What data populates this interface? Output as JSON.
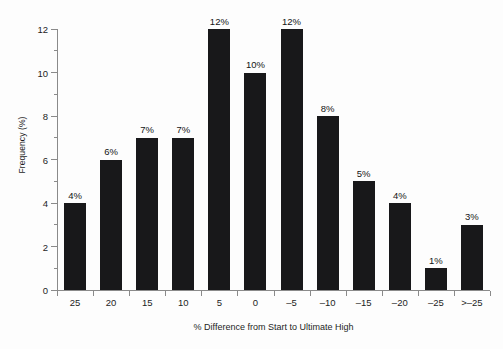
{
  "chart_data": {
    "type": "bar",
    "title": "",
    "subtitle": "",
    "xlabel": "% Difference from Start to Ultimate High",
    "ylabel": "Frequency (%)",
    "categories": [
      "25",
      "20",
      "15",
      "10",
      "5",
      "0",
      "–5",
      "–10",
      "–15",
      "–20",
      "–25",
      ">–25"
    ],
    "values": [
      4,
      6,
      7,
      7,
      12,
      10,
      12,
      8,
      5,
      4,
      1,
      3
    ],
    "data_labels": [
      "4%",
      "6%",
      "7%",
      "7%",
      "12%",
      "10%",
      "12%",
      "8%",
      "5%",
      "4%",
      "1%",
      "3%"
    ],
    "ylim": [
      0,
      12
    ],
    "y_major_ticks": [
      0,
      2,
      4,
      6,
      8,
      10,
      12
    ],
    "y_tick_labels": [
      "0",
      "2",
      "4",
      "6",
      "8",
      "10",
      "12"
    ],
    "y_minor_ticks": [
      1,
      3,
      5,
      7,
      9,
      11
    ],
    "grid": false,
    "legend": false,
    "legend_position": "none",
    "bar_color": "#18181a",
    "axis_color": "#8a8a8a",
    "text_color": "#1d1d1d",
    "background_color": "#fdfdfd"
  }
}
